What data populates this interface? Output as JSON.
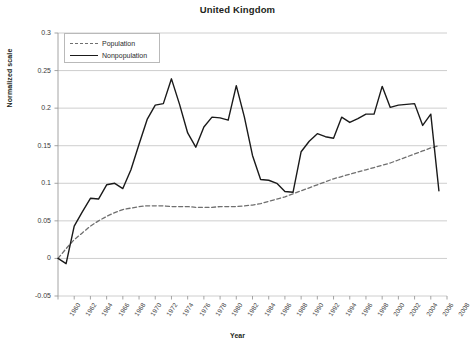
{
  "chart_data": {
    "type": "line",
    "title": "United Kingdom",
    "xlabel": "Year",
    "ylabel": "Normalized scale",
    "grid": true,
    "legend_position": "top-left",
    "xlim": [
      1960,
      2008
    ],
    "ylim": [
      -0.05,
      0.3
    ],
    "ytick_labels": [
      "0.3",
      "0.25",
      "0.2",
      "0.15",
      "0.1",
      "0.05",
      "0",
      "-0.05"
    ],
    "ytick_values": [
      0.3,
      0.25,
      0.2,
      0.15,
      0.1,
      0.05,
      0,
      -0.05
    ],
    "xtick_labels": [
      "1960",
      "1962",
      "1964",
      "1966",
      "1968",
      "1970",
      "1972",
      "1974",
      "1976",
      "1978",
      "1980",
      "1982",
      "1984",
      "1986",
      "1988",
      "1990",
      "1992",
      "1994",
      "1996",
      "1998",
      "2000",
      "2002",
      "2004",
      "2006",
      "2008"
    ],
    "x": [
      1960,
      1961,
      1962,
      1963,
      1964,
      1965,
      1966,
      1967,
      1968,
      1969,
      1970,
      1971,
      1972,
      1973,
      1974,
      1975,
      1976,
      1977,
      1978,
      1979,
      1980,
      1981,
      1982,
      1983,
      1984,
      1985,
      1986,
      1987,
      1988,
      1989,
      1990,
      1991,
      1992,
      1993,
      1994,
      1995,
      1996,
      1997,
      1998,
      1999,
      2000,
      2001,
      2002,
      2003,
      2004,
      2005,
      2006,
      2007
    ],
    "series": [
      {
        "name": "Population",
        "style": "dashed",
        "color": "#6f6f6f",
        "values": [
          0.0,
          0.013,
          0.025,
          0.034,
          0.043,
          0.05,
          0.056,
          0.061,
          0.065,
          0.067,
          0.069,
          0.07,
          0.07,
          0.07,
          0.069,
          0.069,
          0.069,
          0.068,
          0.068,
          0.068,
          0.069,
          0.069,
          0.069,
          0.07,
          0.071,
          0.073,
          0.076,
          0.079,
          0.082,
          0.086,
          0.09,
          0.094,
          0.098,
          0.102,
          0.106,
          0.109,
          0.112,
          0.115,
          0.118,
          0.121,
          0.124,
          0.127,
          0.131,
          0.135,
          0.139,
          0.143,
          0.147,
          0.15
        ]
      },
      {
        "name": "Nonpopulation",
        "style": "solid",
        "color": "#1a1a1a",
        "values": [
          0.0,
          -0.007,
          0.043,
          0.062,
          0.08,
          0.079,
          0.098,
          0.1,
          0.093,
          0.118,
          0.152,
          0.185,
          0.204,
          0.206,
          0.239,
          0.205,
          0.167,
          0.148,
          0.175,
          0.188,
          0.187,
          0.184,
          0.23,
          0.188,
          0.137,
          0.105,
          0.104,
          0.1,
          0.089,
          0.088,
          0.142,
          0.156,
          0.166,
          0.162,
          0.16,
          0.188,
          0.181,
          0.186,
          0.192,
          0.192,
          0.229,
          0.201,
          0.204,
          0.205,
          0.206,
          0.177,
          0.192,
          0.09
        ]
      }
    ]
  },
  "legend": {
    "items": [
      {
        "label": "Population",
        "style": "dashed"
      },
      {
        "label": "Nonpopulation",
        "style": "solid"
      }
    ]
  }
}
